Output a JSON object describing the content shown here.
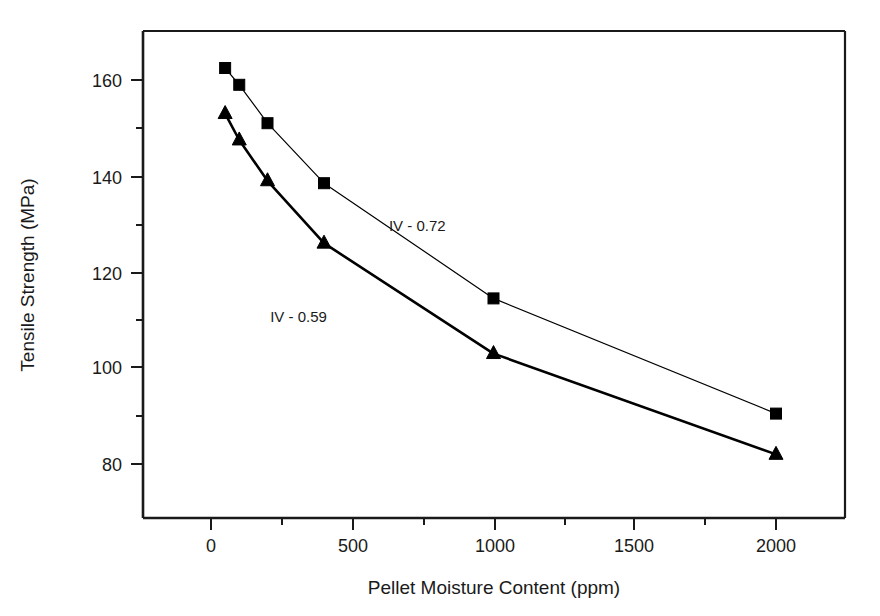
{
  "chart_data": {
    "type": "line",
    "title": "",
    "xlabel": "Pellet Moisture Content (ppm)",
    "ylabel": "Tensile Strength (MPa)",
    "xlim": [
      -250,
      2250
    ],
    "ylim": [
      68,
      170
    ],
    "grid": false,
    "legend_position": "inline-annotation",
    "xticks": [
      0,
      500,
      1000,
      1500,
      2000
    ],
    "xtick_labels": [
      "0",
      "500",
      "1000",
      "1500",
      "2000"
    ],
    "xticks_minor": [
      250,
      750,
      1250,
      1750
    ],
    "yticks": [
      80,
      100,
      120,
      140,
      160
    ],
    "ytick_labels": [
      "80",
      "100",
      "120",
      "140",
      "160"
    ],
    "yticks_minor": [
      90,
      110,
      130,
      150
    ],
    "series": [
      {
        "name": "IV - 0.72",
        "marker": "square",
        "line_width": 1.2,
        "color": "#000000",
        "x": [
          50,
          100,
          200,
          400,
          1000,
          2000
        ],
        "values": [
          162.5,
          159.0,
          151.0,
          138.5,
          114.5,
          90.5
        ]
      },
      {
        "name": "IV - 0.59",
        "marker": "triangle",
        "line_width": 2.6,
        "color": "#000000",
        "x": [
          50,
          100,
          200,
          400,
          1000,
          2000
        ],
        "values": [
          153.0,
          147.5,
          139.0,
          126.0,
          103.0,
          82.0
        ]
      }
    ],
    "annotations": [
      {
        "text": "IV - 0.72",
        "x": 730,
        "y": 128.5
      },
      {
        "text": "IV - 0.59",
        "x": 310,
        "y": 109.5
      }
    ]
  },
  "figure": {
    "background_color": "#ffffff",
    "axis_color": "#1a1a1a"
  }
}
